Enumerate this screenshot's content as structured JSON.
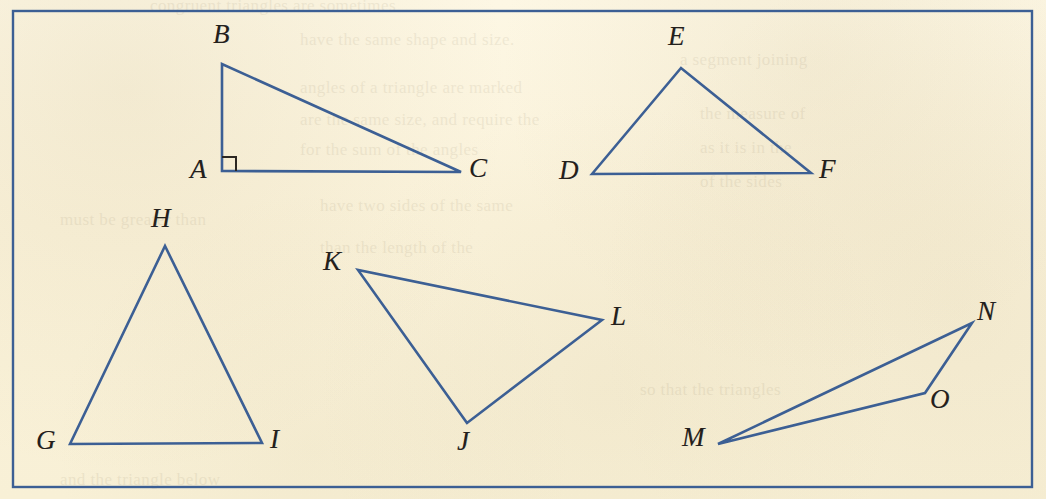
{
  "figure": {
    "title": "Triangles",
    "background_color": "#fbf4dd",
    "line_color": "#3c5f94",
    "label_color": "#23201c",
    "border": {
      "name": "figure-border",
      "color": "#3c5f94",
      "x": 13,
      "y": 11,
      "width": 1019,
      "height": 476,
      "stroke_width": 2.4
    },
    "stroke_width": 2.6,
    "triangles": [
      {
        "name": "triangle-abc",
        "vertices": [
          {
            "label": "A",
            "x": 222,
            "y": 171,
            "label_x": 190,
            "label_y": 156
          },
          {
            "label": "B",
            "x": 222,
            "y": 64,
            "label_x": 213,
            "label_y": 21
          },
          {
            "label": "C",
            "x": 461,
            "y": 172,
            "label_x": 469,
            "label_y": 155
          }
        ],
        "right_angle": {
          "at": "A",
          "size": 14,
          "color": "#2b2722"
        }
      },
      {
        "name": "triangle-def",
        "vertices": [
          {
            "label": "D",
            "x": 592,
            "y": 174,
            "label_x": 559,
            "label_y": 157
          },
          {
            "label": "E",
            "x": 681,
            "y": 68,
            "label_x": 668,
            "label_y": 23
          },
          {
            "label": "F",
            "x": 811,
            "y": 173,
            "label_x": 819,
            "label_y": 156
          }
        ],
        "right_angle": null
      },
      {
        "name": "triangle-ghi",
        "vertices": [
          {
            "label": "G",
            "x": 70,
            "y": 444,
            "label_x": 36,
            "label_y": 427
          },
          {
            "label": "H",
            "x": 165,
            "y": 246,
            "label_x": 151,
            "label_y": 205
          },
          {
            "label": "I",
            "x": 262,
            "y": 443,
            "label_x": 270,
            "label_y": 426
          }
        ],
        "right_angle": null
      },
      {
        "name": "triangle-jkl",
        "vertices": [
          {
            "label": "J",
            "x": 467,
            "y": 423,
            "label_x": 457,
            "label_y": 428
          },
          {
            "label": "K",
            "x": 358,
            "y": 270,
            "label_x": 323,
            "label_y": 248
          },
          {
            "label": "L",
            "x": 602,
            "y": 320,
            "label_x": 611,
            "label_y": 303
          }
        ],
        "right_angle": null
      },
      {
        "name": "triangle-mno",
        "vertices": [
          {
            "label": "M",
            "x": 718,
            "y": 444,
            "label_x": 682,
            "label_y": 424
          },
          {
            "label": "N",
            "x": 972,
            "y": 323,
            "label_x": 977,
            "label_y": 298
          },
          {
            "label": "O",
            "x": 925,
            "y": 393,
            "label_x": 930,
            "label_y": 386
          }
        ],
        "right_angle": null
      }
    ],
    "ghost_text_lines": [
      {
        "text": "congruent triangles are sometimes",
        "x": 150,
        "y": -4
      },
      {
        "text": "have the same shape and size.",
        "x": 300,
        "y": 30
      },
      {
        "text": "angles of a triangle are marked",
        "x": 300,
        "y": 78
      },
      {
        "text": "are the same size, and require the",
        "x": 300,
        "y": 110
      },
      {
        "text": "for the sum of the angles",
        "x": 300,
        "y": 140
      },
      {
        "text": "have two sides of the same",
        "x": 320,
        "y": 196
      },
      {
        "text": "than the length of the",
        "x": 320,
        "y": 238
      },
      {
        "text": "must be greater than",
        "x": 60,
        "y": 210
      },
      {
        "text": "so that the triangles",
        "x": 640,
        "y": 380
      },
      {
        "text": "a segment joining",
        "x": 680,
        "y": 50
      },
      {
        "text": "the measure of",
        "x": 700,
        "y": 104
      },
      {
        "text": "as it is in the",
        "x": 700,
        "y": 138
      },
      {
        "text": "of the sides",
        "x": 700,
        "y": 172
      },
      {
        "text": "and the triangle below",
        "x": 60,
        "y": 470
      }
    ]
  }
}
